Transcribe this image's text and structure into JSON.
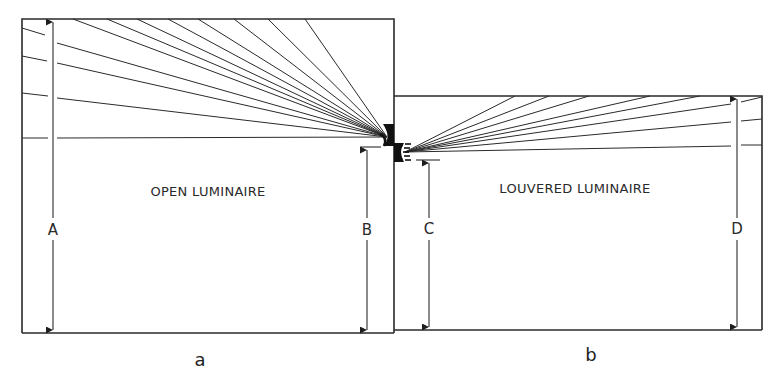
{
  "figure": {
    "panels": [
      {
        "id": "a",
        "caption": "a",
        "room_label": "OPEN LUMINAIRE",
        "dimensions": [
          {
            "label": "A",
            "description": "full height from floor to ceiling (left wall)"
          },
          {
            "label": "B",
            "description": "height from floor to luminaire"
          }
        ]
      },
      {
        "id": "b",
        "caption": "b",
        "room_label": "LOUVERED LUMINAIRE",
        "dimensions": [
          {
            "label": "C",
            "description": "height from floor to luminaire"
          },
          {
            "label": "D",
            "description": "full height from floor to ceiling (right wall)"
          }
        ]
      }
    ],
    "colors": {
      "line": "#2a2a2a",
      "background": "#ffffff"
    }
  }
}
